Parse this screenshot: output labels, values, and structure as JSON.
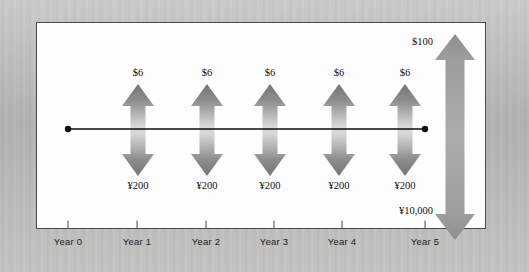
{
  "figure": {
    "type": "cash-flow-timeline-diagram",
    "background_color": "#bababa",
    "panel_color": "#fdfdfd",
    "panel_border_color": "#4a4a4a",
    "timeline_color": "#0d0d0d",
    "arrow_dark": "#7b7b7b",
    "arrow_light": "#d5d5d5"
  },
  "axis": {
    "ticks": [
      {
        "label": "Year 0",
        "x": 68
      },
      {
        "label": "Year 1",
        "x": 137
      },
      {
        "label": "Year 2",
        "x": 206
      },
      {
        "label": "Year 3",
        "x": 274
      },
      {
        "label": "Year 4",
        "x": 342
      },
      {
        "label": "Year 5",
        "x": 425
      }
    ]
  },
  "timeline": {
    "start_marker_x": 68,
    "end_marker_x": 425,
    "y": 129
  },
  "coupon_arrows": [
    {
      "year": "Year 1",
      "x": 138,
      "up_label": "$6",
      "down_label": "¥200"
    },
    {
      "year": "Year 2",
      "x": 207,
      "up_label": "$6",
      "down_label": "¥200"
    },
    {
      "year": "Year 3",
      "x": 270,
      "up_label": "$6",
      "down_label": "¥200"
    },
    {
      "year": "Year 4",
      "x": 339,
      "up_label": "$6",
      "down_label": "¥200"
    },
    {
      "year": "Year 5",
      "x": 405,
      "up_label": "$6",
      "down_label": "¥200"
    }
  ],
  "principal_arrow": {
    "x": 455,
    "up_label": "$100",
    "down_label": "¥10,000"
  },
  "chart_data": {
    "type": "bar",
    "title": "",
    "xlabel": "",
    "ylabel": "",
    "categories": [
      "Year 0",
      "Year 1",
      "Year 2",
      "Year 3",
      "Year 4",
      "Year 5"
    ],
    "series": [
      {
        "name": "Dollar inflow (up arrow)",
        "values": [
          null,
          "$6",
          "$6",
          "$6",
          "$6",
          "$6"
        ]
      },
      {
        "name": "Yen outflow (down arrow)",
        "values": [
          null,
          "¥200",
          "¥200",
          "¥200",
          "¥200",
          "¥200"
        ]
      },
      {
        "name": "Dollar principal",
        "values": [
          null,
          null,
          null,
          null,
          null,
          "$100"
        ]
      },
      {
        "name": "Yen principal",
        "values": [
          null,
          null,
          null,
          null,
          null,
          "¥10,000"
        ]
      }
    ],
    "legend_position": "none",
    "grid": false
  }
}
